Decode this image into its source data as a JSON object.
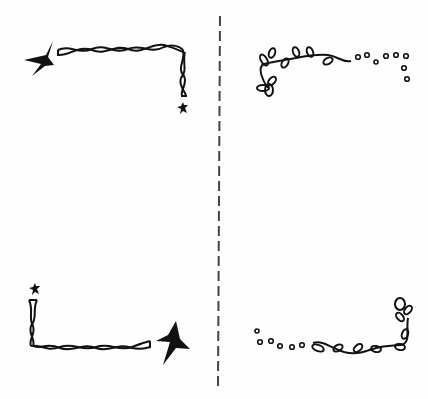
{
  "illustration": {
    "description": "Four hand-drawn decorative corner doodles separated by a vertical dashed divider",
    "ink_color": "#111111",
    "divider_color": "#444444",
    "background": "#fefefe",
    "panels": [
      {
        "position": "top-left",
        "motif": "twisted-rope-with-stars"
      },
      {
        "position": "top-right",
        "motif": "leafy-vine-with-dots"
      },
      {
        "position": "bottom-left",
        "motif": "twisted-rope-with-stars"
      },
      {
        "position": "bottom-right",
        "motif": "leafy-vine-with-dots"
      }
    ]
  }
}
